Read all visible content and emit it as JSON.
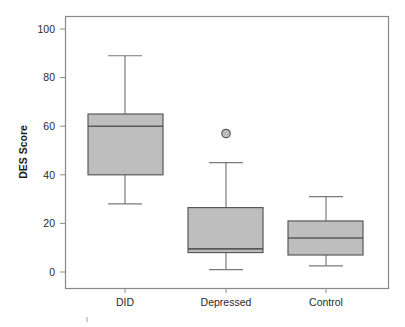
{
  "chart_data": {
    "type": "box",
    "title": "",
    "subtitle": "",
    "xlabel": "",
    "ylabel": "DES Score",
    "categories": [
      "DID",
      "Depressed",
      "Control"
    ],
    "ylim": [
      0,
      100
    ],
    "yticks": [
      0,
      20,
      40,
      60,
      80,
      100
    ],
    "ytick_labels": [
      "0",
      "20",
      "40",
      "60",
      "80",
      "100"
    ],
    "grid": false,
    "legend": false,
    "legend_position": "none",
    "box_fill_color": "#bebebe",
    "box_edge_color": "#585858",
    "frame_color": "#888888",
    "boxes": [
      {
        "category": "DID",
        "whisker_low": 28,
        "q1": 40,
        "median": 60,
        "q3": 65,
        "whisker_high": 89,
        "outliers": []
      },
      {
        "category": "Depressed",
        "whisker_low": 1,
        "q1": 8,
        "median": 9.5,
        "q3": 26.5,
        "whisker_high": 45,
        "outliers": [
          57
        ]
      },
      {
        "category": "Control",
        "whisker_low": 2.5,
        "q1": 7,
        "median": 14,
        "q3": 21,
        "whisker_high": 31,
        "outliers": []
      }
    ]
  },
  "axes": {
    "y_title": "DES Score",
    "y_tick_0": "0",
    "y_tick_1": "20",
    "y_tick_2": "40",
    "y_tick_3": "60",
    "y_tick_4": "80",
    "y_tick_5": "100",
    "x_cat_0": "DID",
    "x_cat_1": "Depressed",
    "x_cat_2": "Control"
  }
}
